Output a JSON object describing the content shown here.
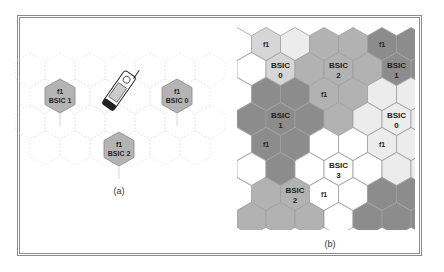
{
  "panel_a": {
    "caption": "(a)",
    "cells": [
      {
        "freq": "f1",
        "bsic": "BSIC 1",
        "cx": 60,
        "cy": 96
      },
      {
        "freq": "f1",
        "bsic": "BSIC 0",
        "cx": 177,
        "cy": 96
      },
      {
        "freq": "f1",
        "bsic": "BSIC 2",
        "cx": 119,
        "cy": 149
      }
    ],
    "device_icon": "mobile-phone-icon"
  },
  "panel_b": {
    "caption": "(b)",
    "colors": {
      "dark": "#8c8c8c",
      "mid": "#b2b2b2",
      "light": "#d6d6d6",
      "vlight": "#ececec",
      "white": "#ffffff",
      "border": "#a0a0a0"
    },
    "rows": [
      [
        "light",
        "vlight",
        "mid",
        "mid",
        "dark",
        "dark"
      ],
      [
        "white",
        "light",
        "mid",
        "mid",
        "mid",
        "dark"
      ],
      [
        "dark",
        "dark",
        "mid",
        "mid",
        "vlight",
        "vlight"
      ],
      [
        "dark",
        "dark",
        "dark",
        "mid",
        "vlight",
        "vlight"
      ],
      [
        "dark",
        "dark",
        "white",
        "white",
        "vlight",
        "vlight"
      ],
      [
        "white",
        "dark",
        "white",
        "white",
        "white",
        "vlight"
      ],
      [
        "mid",
        "mid",
        "white",
        "white",
        "dark",
        "dark"
      ],
      [
        "mid",
        "mid",
        "mid",
        "white",
        "dark",
        "dark"
      ]
    ],
    "labels": [
      {
        "row": 0,
        "col": 0,
        "text": [
          "f1"
        ]
      },
      {
        "row": 0,
        "col": 4,
        "text": [
          "f1"
        ]
      },
      {
        "row": 1,
        "col": 1,
        "text": [
          "BSIC",
          "0"
        ]
      },
      {
        "row": 1,
        "col": 3,
        "text": [
          "BSIC",
          "2"
        ]
      },
      {
        "row": 1,
        "col": 5,
        "text": [
          "BSIC",
          "1"
        ]
      },
      {
        "row": 2,
        "col": 2,
        "text": [
          "f1"
        ]
      },
      {
        "row": 3,
        "col": 1,
        "text": [
          "BSIC",
          "1"
        ]
      },
      {
        "row": 3,
        "col": 5,
        "text": [
          "BSIC",
          "0"
        ]
      },
      {
        "row": 4,
        "col": 0,
        "text": [
          "f1"
        ]
      },
      {
        "row": 4,
        "col": 4,
        "text": [
          "f1"
        ]
      },
      {
        "row": 5,
        "col": 3,
        "text": [
          "BSIC",
          "3"
        ]
      },
      {
        "row": 6,
        "col": 1,
        "text": [
          "BSIC",
          "2"
        ]
      },
      {
        "row": 6,
        "col": 2,
        "text": [
          "f1"
        ]
      }
    ]
  }
}
